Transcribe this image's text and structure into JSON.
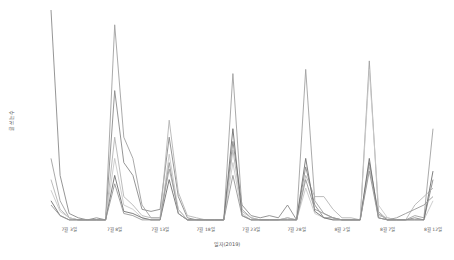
{
  "chart_data": {
    "type": "line",
    "title": "",
    "xlabel": "일자(2019)",
    "ylabel": "글 쓰는수",
    "legend": "none",
    "grid": false,
    "x_tick_labels": [
      "7월 3일",
      "7월 8일",
      "7월 13일",
      "7월 18일",
      "7월 23일",
      "7월 28일",
      "8월 2일",
      "8월 7일",
      "8월 12일"
    ],
    "x_tick_days": [
      2,
      7,
      12,
      17,
      22,
      27,
      32,
      37,
      42
    ],
    "x": [
      0,
      1,
      2,
      3,
      4,
      5,
      6,
      7,
      8,
      9,
      10,
      11,
      12,
      13,
      14,
      15,
      16,
      17,
      18,
      19,
      20,
      21,
      22,
      23,
      24,
      25,
      26,
      27,
      28,
      29,
      30,
      31,
      32,
      33,
      34,
      35,
      36,
      37,
      38,
      39,
      40,
      41,
      42
    ],
    "ylim": [
      0,
      100
    ],
    "series": [
      {
        "name": "series-1",
        "color": "#8a8a8a",
        "values": [
          100,
          22,
          4,
          2,
          1,
          2,
          1,
          62,
          28,
          22,
          6,
          5,
          6,
          40,
          12,
          2,
          1,
          1,
          1,
          1,
          38,
          8,
          3,
          2,
          3,
          2,
          8,
          1,
          26,
          8,
          2,
          2,
          1,
          1,
          1,
          28,
          4,
          1,
          1,
          1,
          2,
          1,
          20
        ]
      },
      {
        "name": "series-2",
        "color": "#a0a0a0",
        "values": [
          30,
          10,
          2,
          1,
          1,
          1,
          1,
          93,
          40,
          30,
          8,
          2,
          2,
          25,
          6,
          1,
          1,
          1,
          1,
          1,
          70,
          6,
          2,
          1,
          1,
          1,
          2,
          1,
          72,
          10,
          4,
          2,
          1,
          1,
          1,
          76,
          5,
          1,
          1,
          1,
          3,
          2,
          44
        ]
      },
      {
        "name": "series-3",
        "color": "#b4b4b4",
        "values": [
          20,
          6,
          2,
          1,
          1,
          1,
          1,
          40,
          12,
          8,
          3,
          2,
          2,
          48,
          14,
          3,
          2,
          1,
          1,
          1,
          34,
          5,
          2,
          1,
          1,
          1,
          2,
          1,
          22,
          12,
          12,
          6,
          2,
          2,
          1,
          26,
          3,
          2,
          1,
          1,
          8,
          12,
          16
        ]
      },
      {
        "name": "series-4",
        "color": "#c8c8c8",
        "values": [
          15,
          5,
          2,
          1,
          1,
          1,
          1,
          30,
          8,
          6,
          2,
          1,
          1,
          32,
          6,
          1,
          1,
          1,
          1,
          1,
          28,
          4,
          1,
          1,
          1,
          1,
          1,
          1,
          16,
          4,
          2,
          1,
          1,
          1,
          1,
          72,
          8,
          2,
          1,
          1,
          1,
          1,
          10
        ]
      },
      {
        "name": "series-5",
        "color": "#707070",
        "values": [
          10,
          3,
          1,
          1,
          1,
          1,
          1,
          22,
          5,
          4,
          2,
          1,
          1,
          20,
          4,
          1,
          1,
          1,
          1,
          1,
          44,
          3,
          1,
          1,
          1,
          1,
          1,
          1,
          30,
          5,
          2,
          1,
          1,
          1,
          1,
          30,
          2,
          1,
          1,
          1,
          1,
          1,
          24
        ]
      },
      {
        "name": "series-6",
        "color": "#989898",
        "values": [
          8,
          3,
          1,
          1,
          1,
          1,
          1,
          18,
          4,
          3,
          1,
          1,
          1,
          28,
          4,
          1,
          1,
          1,
          1,
          1,
          22,
          3,
          1,
          1,
          1,
          1,
          1,
          1,
          20,
          6,
          4,
          2,
          1,
          1,
          1,
          24,
          2,
          1,
          2,
          4,
          6,
          8,
          12
        ]
      }
    ]
  },
  "axes": {
    "xlabel": "일자(2019)",
    "ylabel": "글 쓰는수"
  }
}
